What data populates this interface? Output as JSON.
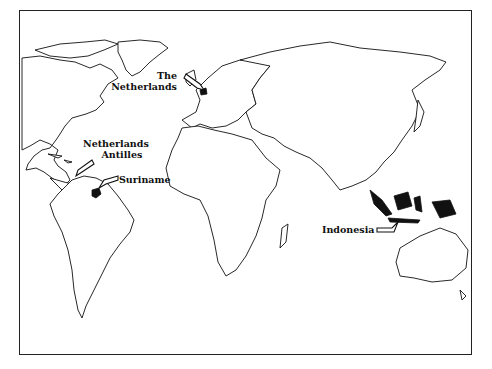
{
  "map": {
    "type": "world outline map",
    "highlight_color": "#111111",
    "labels": {
      "netherlands_line1": "The",
      "netherlands_line2": "Netherlands",
      "antilles_line1": "Netherlands",
      "antilles_line2": "Antilles",
      "suriname": "Suriname",
      "indonesia": "Indonesia"
    },
    "highlighted_regions": [
      "The Netherlands",
      "Netherlands Antilles",
      "Suriname",
      "Indonesia"
    ]
  }
}
